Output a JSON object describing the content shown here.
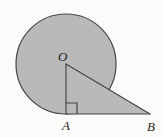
{
  "figure": {
    "kind": "geometry-diagram",
    "background_color": "#fbfbfa",
    "fill_color": "#b9b9b9",
    "stroke_color": "#454545",
    "label_color": "#1b1b1b",
    "stroke_width": 1.2,
    "width": 163,
    "height": 137
  },
  "labels": {
    "center": "O",
    "tangent_point": "A",
    "far_point": "B"
  },
  "points": {
    "O": {
      "x": 66,
      "y": 64,
      "label": "O"
    },
    "A": {
      "x": 66,
      "y": 114,
      "label": "A"
    },
    "B": {
      "x": 150,
      "y": 114,
      "label": "B"
    }
  },
  "circle": {
    "center_x": 66,
    "center_y": 64,
    "radius": 50
  },
  "triangle": {
    "vertices": [
      {
        "name": "O",
        "x": 66,
        "y": 64
      },
      {
        "name": "A",
        "x": 66,
        "y": 114
      },
      {
        "name": "B",
        "x": 150,
        "y": 114
      }
    ],
    "right_angle_at": "A",
    "right_angle_marker_size": 11
  },
  "segments": [
    {
      "name": "OA",
      "from": "O",
      "to": "A"
    },
    {
      "name": "AB",
      "from": "A",
      "to": "B"
    },
    {
      "name": "OB",
      "from": "O",
      "to": "B"
    }
  ]
}
